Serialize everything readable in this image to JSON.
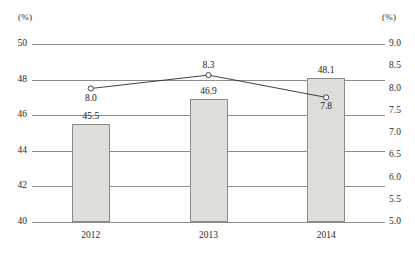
{
  "chart_data": {
    "type": "bar",
    "title": "",
    "subtitle": "",
    "xlabel": "",
    "categories": [
      "2012",
      "2013",
      "2014"
    ],
    "left_axis": {
      "label": "(%)",
      "ylim": [
        40,
        50
      ],
      "ticks": [
        "40",
        "42",
        "44",
        "46",
        "48",
        "50"
      ],
      "tick_values": [
        40,
        42,
        44,
        46,
        48,
        50
      ],
      "gridlines": true
    },
    "right_axis": {
      "label": "(%)",
      "ylim": [
        5.0,
        9.0
      ],
      "ticks": [
        "5.0",
        "5.5",
        "6.0",
        "6.5",
        "7.0",
        "7.5",
        "8.0",
        "8.5",
        "9.0"
      ],
      "tick_values": [
        5.0,
        5.5,
        6.0,
        6.5,
        7.0,
        7.5,
        8.0,
        8.5,
        9.0
      ],
      "gridlines": false
    },
    "legend": [],
    "legend_position": "none",
    "grid": true,
    "series": [
      {
        "name": "bars",
        "type": "bar",
        "axis": "left",
        "values": [
          45.5,
          46.9,
          48.1
        ],
        "labels": [
          "45.5",
          "46.9",
          "48.1"
        ],
        "fill_color": "#dededa",
        "border_color": "#8a8a86"
      },
      {
        "name": "line",
        "type": "line",
        "axis": "right",
        "values": [
          8.0,
          8.3,
          7.8
        ],
        "labels": [
          "8.0",
          "8.3",
          "7.8"
        ],
        "line_color": "#2b2b2b",
        "marker": "open-circle"
      }
    ]
  },
  "axes": {
    "left_unit": "(%)",
    "right_unit": "(%)"
  }
}
